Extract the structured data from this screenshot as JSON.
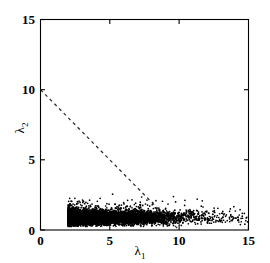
{
  "figure": {
    "background_color": "#ffffff",
    "foreground_color": "#000000",
    "width": 270,
    "height": 263
  },
  "chart_data": {
    "type": "scatter",
    "title": "",
    "subtitle": "",
    "xlabel": "λ₁",
    "ylabel": "λ₂",
    "xlabel_base": "λ",
    "xlabel_sub": "1",
    "ylabel_base": "λ",
    "ylabel_sub": "2",
    "xlim": [
      0,
      15
    ],
    "ylim": [
      0,
      15
    ],
    "xticks": [
      0,
      5,
      10,
      15
    ],
    "yticks": [
      0,
      5,
      10,
      15
    ],
    "xtick_labels": [
      "0",
      "5",
      "10",
      "15"
    ],
    "ytick_labels": [
      "0",
      "5",
      "10",
      "15"
    ],
    "grid": false,
    "legend": null,
    "legend_position": "none",
    "marker": "dot",
    "marker_color": "#000000",
    "marker_size_px": 0.85,
    "point_count": 9000,
    "cloud_description": "dense horizontal band of points near the x-axis",
    "cloud": {
      "x_range": [
        2.0,
        15.0
      ],
      "y_range": [
        0.25,
        2.6
      ],
      "core_x_range": [
        2.4,
        7.6
      ],
      "core_y_range": [
        0.45,
        1.35
      ],
      "core_y_center": 0.88,
      "core_y_spread": 0.26,
      "density_decay_start_x": 7.0,
      "tail_sparse_x_range": [
        9.5,
        15.0
      ]
    },
    "annotations": [
      {
        "name": "threshold-line",
        "type": "line",
        "style": "dashed",
        "color": "#2b2b2b",
        "equation": "λ₁ + λ₂ = 10",
        "x_start": 0,
        "y_start": 10,
        "x_end": 10,
        "y_end": 0,
        "slope": -1,
        "intercept": 10
      }
    ]
  },
  "axes": {
    "x_axis_name": "lambda-1-axis",
    "y_axis_name": "lambda-2-axis",
    "frame": true,
    "tick_direction": "in"
  }
}
